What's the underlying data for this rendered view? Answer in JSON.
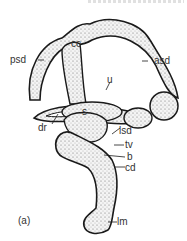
{
  "figure": {
    "panel_label": "(a)",
    "labels": [
      {
        "id": "cc",
        "text": "cc"
      },
      {
        "id": "psd",
        "text": "psd"
      },
      {
        "id": "asd",
        "text": "asd"
      },
      {
        "id": "u",
        "text": "u"
      },
      {
        "id": "s",
        "text": "s"
      },
      {
        "id": "dr",
        "text": "dr"
      },
      {
        "id": "lsd",
        "text": "lsd"
      },
      {
        "id": "tv",
        "text": "tv"
      },
      {
        "id": "b",
        "text": "b"
      },
      {
        "id": "cd",
        "text": "cd"
      },
      {
        "id": "lm",
        "text": "lm"
      }
    ]
  },
  "colors": {
    "outline": "#1a1a1a",
    "fill": "#f2f2f2",
    "stipple": "#555555",
    "text": "#333333"
  }
}
